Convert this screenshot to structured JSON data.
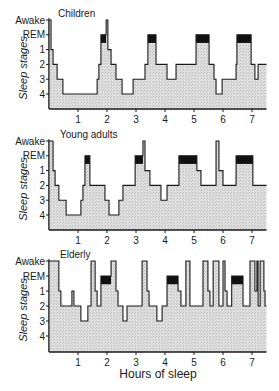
{
  "chart_data": {
    "type": "line",
    "subtype": "step-hypnogram",
    "title": "",
    "xlabel": "Hours of sleep",
    "ylabel": "Sleep stages",
    "x_ticks": [
      1,
      2,
      3,
      4,
      5,
      6,
      7
    ],
    "xlim": [
      0,
      7.5
    ],
    "y_categories": [
      "Awake",
      "REM",
      "1",
      "2",
      "3",
      "4"
    ],
    "legend": [],
    "colors": {
      "fill": "#d9d9d9",
      "line": "#1a1a1a",
      "rem_bar": "#111111"
    },
    "panels": [
      {
        "title": "Children",
        "steps": [
          [
            0.0,
            "Awake"
          ],
          [
            0.07,
            "1"
          ],
          [
            0.14,
            "2"
          ],
          [
            0.28,
            "3"
          ],
          [
            0.48,
            "4"
          ],
          [
            1.66,
            "3"
          ],
          [
            1.72,
            "2"
          ],
          [
            1.79,
            "REM"
          ],
          [
            1.97,
            "Awake"
          ],
          [
            2.03,
            "1"
          ],
          [
            2.14,
            "2"
          ],
          [
            2.31,
            "3"
          ],
          [
            2.52,
            "4"
          ],
          [
            2.9,
            "3"
          ],
          [
            3.31,
            "2"
          ],
          [
            3.41,
            "REM"
          ],
          [
            3.69,
            "2"
          ],
          [
            4.07,
            "3"
          ],
          [
            4.38,
            "2"
          ],
          [
            5.07,
            "REM"
          ],
          [
            5.52,
            "2"
          ],
          [
            5.69,
            "3"
          ],
          [
            5.76,
            "4"
          ],
          [
            5.97,
            "3"
          ],
          [
            6.45,
            "2"
          ],
          [
            6.48,
            "REM"
          ],
          [
            6.97,
            "2"
          ],
          [
            7.1,
            "3"
          ],
          [
            7.21,
            "2"
          ],
          [
            7.5,
            "2"
          ]
        ],
        "rem_periods": [
          [
            1.79,
            1.97
          ],
          [
            3.41,
            3.69
          ],
          [
            5.07,
            5.52
          ],
          [
            6.48,
            6.97
          ]
        ]
      },
      {
        "title": "Young adults",
        "steps": [
          [
            0.0,
            "Awake"
          ],
          [
            0.14,
            "1"
          ],
          [
            0.21,
            "2"
          ],
          [
            0.34,
            "3"
          ],
          [
            0.59,
            "4"
          ],
          [
            1.1,
            "3"
          ],
          [
            1.17,
            "2"
          ],
          [
            1.24,
            "REM"
          ],
          [
            1.41,
            "2"
          ],
          [
            1.93,
            "3"
          ],
          [
            2.07,
            "4"
          ],
          [
            2.41,
            "3"
          ],
          [
            2.55,
            "2"
          ],
          [
            2.97,
            "REM"
          ],
          [
            3.24,
            "Awake"
          ],
          [
            3.31,
            "1"
          ],
          [
            3.48,
            "2"
          ],
          [
            3.86,
            "3"
          ],
          [
            4.07,
            "2"
          ],
          [
            4.48,
            "REM"
          ],
          [
            5.1,
            "1"
          ],
          [
            5.24,
            "2"
          ],
          [
            5.76,
            "Awake"
          ],
          [
            5.86,
            "1"
          ],
          [
            6.0,
            "2"
          ],
          [
            6.45,
            "REM"
          ],
          [
            7.03,
            "2"
          ],
          [
            7.5,
            "2"
          ]
        ],
        "rem_periods": [
          [
            1.24,
            1.41
          ],
          [
            2.97,
            3.24
          ],
          [
            4.48,
            5.1
          ],
          [
            6.45,
            7.03
          ]
        ]
      },
      {
        "title": "Elderly",
        "steps": [
          [
            0.0,
            "Awake"
          ],
          [
            0.34,
            "1"
          ],
          [
            0.41,
            "2"
          ],
          [
            0.79,
            "1"
          ],
          [
            0.86,
            "2"
          ],
          [
            1.1,
            "3"
          ],
          [
            1.34,
            "2"
          ],
          [
            1.45,
            "Awake"
          ],
          [
            1.59,
            "1"
          ],
          [
            1.66,
            "2"
          ],
          [
            1.79,
            "REM"
          ],
          [
            2.14,
            "Awake"
          ],
          [
            2.31,
            "1"
          ],
          [
            2.38,
            "2"
          ],
          [
            2.55,
            "3"
          ],
          [
            2.69,
            "2"
          ],
          [
            3.21,
            "Awake"
          ],
          [
            3.38,
            "1"
          ],
          [
            3.45,
            "2"
          ],
          [
            3.72,
            "3"
          ],
          [
            3.9,
            "2"
          ],
          [
            4.07,
            "REM"
          ],
          [
            4.45,
            "1"
          ],
          [
            4.55,
            "2"
          ],
          [
            4.72,
            "Awake"
          ],
          [
            4.86,
            "2"
          ],
          [
            5.31,
            "Awake"
          ],
          [
            5.48,
            "1"
          ],
          [
            5.55,
            "2"
          ],
          [
            5.66,
            "Awake"
          ],
          [
            5.86,
            "2"
          ],
          [
            6.0,
            "Awake"
          ],
          [
            6.07,
            "1"
          ],
          [
            6.14,
            "2"
          ],
          [
            6.3,
            "REM"
          ],
          [
            6.69,
            "2"
          ],
          [
            6.93,
            "Awake"
          ],
          [
            7.1,
            "1"
          ],
          [
            7.17,
            "Awake"
          ],
          [
            7.21,
            "2"
          ],
          [
            7.28,
            "Awake"
          ],
          [
            7.41,
            "1"
          ],
          [
            7.45,
            "2"
          ],
          [
            7.5,
            "2"
          ]
        ],
        "rem_periods": [
          [
            1.79,
            2.14
          ],
          [
            4.07,
            4.45
          ],
          [
            6.3,
            6.69
          ]
        ]
      }
    ]
  },
  "panels": [
    {
      "title": "Children",
      "ylabel": "Sleep stages"
    },
    {
      "title": "Young adults",
      "ylabel": "Sleep stages"
    },
    {
      "title": "Elderly",
      "ylabel": "Sleep stages"
    }
  ],
  "axis": {
    "xlabel": "Hours of sleep",
    "y_tick_labels": [
      "Awake",
      "REM",
      "1",
      "2",
      "3",
      "4"
    ],
    "x_tick_labels": [
      "1",
      "2",
      "3",
      "4",
      "5",
      "6",
      "7"
    ]
  }
}
